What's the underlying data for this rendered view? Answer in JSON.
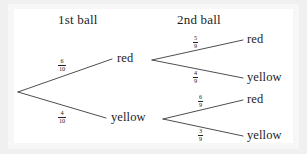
{
  "figure": {
    "type": "probability-tree-diagram",
    "background_color": "#f0f0f0",
    "paper_color": "#ffffff",
    "line_color": "#3a3a3a",
    "text_color": "#1d1d1d"
  },
  "headings": {
    "first": "1st ball",
    "second": "2nd ball"
  },
  "nodes": {
    "level1": [
      {
        "label": "red",
        "probability_numerator": "6",
        "probability_denominator": "10"
      },
      {
        "label": "yellow",
        "probability_numerator": "4",
        "probability_denominator": "10"
      }
    ],
    "level2": [
      {
        "label": "red",
        "probability_numerator": "5",
        "probability_denominator": "9"
      },
      {
        "label": "yellow",
        "probability_numerator": "4",
        "probability_denominator": "9"
      },
      {
        "label": "red",
        "probability_numerator": "6",
        "probability_denominator": "9"
      },
      {
        "label": "yellow",
        "probability_numerator": "3",
        "probability_denominator": "9"
      }
    ]
  }
}
